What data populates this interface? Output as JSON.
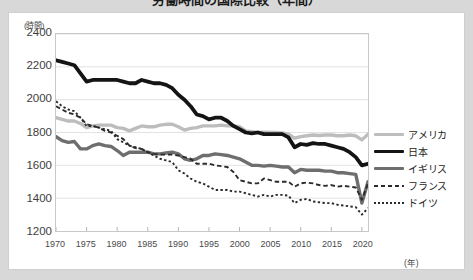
{
  "title": "労働時間の国際比較（年間）",
  "axis": {
    "y_unit": "(時間)",
    "x_unit": "(年)",
    "y_ticks": [
      "2400",
      "2200",
      "2000",
      "1800",
      "1600",
      "1400",
      "1200"
    ],
    "x_ticks": [
      "1970",
      "1975",
      "1980",
      "1985",
      "1990",
      "1995",
      "2000",
      "2005",
      "2010",
      "2015",
      "2020"
    ]
  },
  "legend": {
    "items": [
      {
        "label": "アメリカ",
        "color": "#bdbdbd",
        "style": "solid",
        "width": 3.4
      },
      {
        "label": "日本",
        "color": "#141414",
        "style": "solid",
        "width": 3.8
      },
      {
        "label": "イギリス",
        "color": "#6e6e6e",
        "style": "solid",
        "width": 3.4
      },
      {
        "label": "フランス",
        "color": "#2b2b2b",
        "style": "dashed",
        "width": 1.9
      },
      {
        "label": "ドイツ",
        "color": "#2b2b2b",
        "style": "dotted",
        "width": 1.9
      }
    ]
  },
  "chart_data": {
    "type": "line",
    "title": "労働時間の国際比較（年間）",
    "xlabel": "(年)",
    "ylabel": "(時間)",
    "xlim": [
      1970,
      2021
    ],
    "ylim": [
      1200,
      2400
    ],
    "ytick_step": 200,
    "xtick_step": 5,
    "grid": "horizontal",
    "legend_position": "right",
    "x": [
      1970,
      1971,
      1972,
      1973,
      1974,
      1975,
      1976,
      1977,
      1978,
      1979,
      1980,
      1981,
      1982,
      1983,
      1984,
      1985,
      1986,
      1987,
      1988,
      1989,
      1990,
      1991,
      1992,
      1993,
      1994,
      1995,
      1996,
      1997,
      1998,
      1999,
      2000,
      2001,
      2002,
      2003,
      2004,
      2005,
      2006,
      2007,
      2008,
      2009,
      2010,
      2011,
      2012,
      2013,
      2014,
      2015,
      2016,
      2017,
      2018,
      2019,
      2020,
      2021
    ],
    "series": [
      {
        "name": "アメリカ",
        "color": "#bdbdbd",
        "style": "solid",
        "values": [
          1890,
          1880,
          1870,
          1870,
          1855,
          1830,
          1840,
          1845,
          1845,
          1845,
          1830,
          1825,
          1810,
          1825,
          1840,
          1835,
          1835,
          1845,
          1850,
          1850,
          1835,
          1815,
          1825,
          1830,
          1840,
          1840,
          1840,
          1845,
          1840,
          1840,
          1835,
          1810,
          1805,
          1800,
          1802,
          1800,
          1800,
          1798,
          1790,
          1765,
          1775,
          1780,
          1785,
          1782,
          1785,
          1785,
          1780,
          1780,
          1785,
          1780,
          1755,
          1790
        ]
      },
      {
        "name": "日本",
        "color": "#141414",
        "style": "solid",
        "values": [
          2240,
          2230,
          2220,
          2210,
          2160,
          2110,
          2120,
          2120,
          2120,
          2120,
          2120,
          2110,
          2100,
          2100,
          2120,
          2110,
          2100,
          2100,
          2090,
          2070,
          2030,
          2000,
          1960,
          1910,
          1900,
          1880,
          1890,
          1890,
          1870,
          1840,
          1820,
          1800,
          1795,
          1800,
          1790,
          1790,
          1790,
          1790,
          1770,
          1710,
          1730,
          1725,
          1735,
          1730,
          1730,
          1720,
          1710,
          1700,
          1680,
          1650,
          1600,
          1610
        ]
      },
      {
        "name": "イギリス",
        "color": "#6e6e6e",
        "style": "solid",
        "values": [
          1775,
          1750,
          1740,
          1745,
          1700,
          1700,
          1720,
          1730,
          1720,
          1715,
          1690,
          1660,
          1680,
          1680,
          1680,
          1680,
          1670,
          1670,
          1675,
          1680,
          1670,
          1640,
          1630,
          1640,
          1660,
          1660,
          1670,
          1665,
          1660,
          1650,
          1640,
          1620,
          1600,
          1600,
          1595,
          1600,
          1595,
          1590,
          1590,
          1555,
          1575,
          1570,
          1570,
          1570,
          1565,
          1565,
          1555,
          1555,
          1550,
          1545,
          1370,
          1500
        ]
      },
      {
        "name": "フランス",
        "color": "#2b2b2b",
        "style": "dashed",
        "values": [
          1960,
          1940,
          1920,
          1910,
          1890,
          1850,
          1840,
          1830,
          1810,
          1800,
          1780,
          1760,
          1720,
          1705,
          1700,
          1680,
          1670,
          1665,
          1665,
          1665,
          1660,
          1650,
          1640,
          1610,
          1610,
          1610,
          1600,
          1595,
          1590,
          1560,
          1510,
          1500,
          1490,
          1490,
          1520,
          1510,
          1500,
          1500,
          1500,
          1470,
          1490,
          1495,
          1490,
          1480,
          1475,
          1480,
          1470,
          1475,
          1470,
          1465,
          1390,
          1490
        ]
      },
      {
        "name": "ドイツ",
        "color": "#2b2b2b",
        "style": "dotted",
        "values": [
          1990,
          1960,
          1940,
          1930,
          1890,
          1840,
          1840,
          1830,
          1820,
          1810,
          1760,
          1740,
          1720,
          1710,
          1700,
          1680,
          1660,
          1640,
          1630,
          1620,
          1570,
          1550,
          1520,
          1500,
          1490,
          1470,
          1450,
          1450,
          1450,
          1440,
          1440,
          1430,
          1420,
          1410,
          1420,
          1410,
          1420,
          1420,
          1415,
          1370,
          1390,
          1395,
          1380,
          1375,
          1370,
          1370,
          1360,
          1355,
          1350,
          1345,
          1300,
          1340
        ]
      }
    ]
  }
}
